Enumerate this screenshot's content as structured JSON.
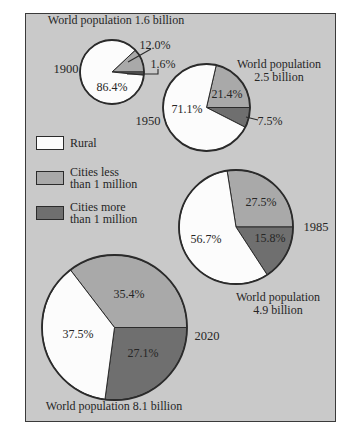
{
  "figure": {
    "bg": "#c9c9c9",
    "colors": {
      "bg": "#c9c9c9",
      "rural": "#fcfcfc",
      "less": "#a9a9a9",
      "more": "#6f6f6f",
      "outline": "#2b2b2b",
      "text": "#262626"
    }
  },
  "legend": {
    "items": [
      {
        "key": "rural",
        "lines": [
          "Rural"
        ]
      },
      {
        "key": "less",
        "lines": [
          "Cities less",
          "than 1 million"
        ]
      },
      {
        "key": "more",
        "lines": [
          "Cities more",
          "than 1 million"
        ]
      }
    ]
  },
  "chart_data": [
    {
      "type": "pie",
      "year": "1900",
      "total_population_billion": 1.6,
      "population_label_lines": [
        "World population 1.6 billion"
      ],
      "slices": [
        {
          "key": "less",
          "label": "Cities less than 1 million",
          "pct": 12.0,
          "display": "12.0%"
        },
        {
          "key": "more",
          "label": "Cities more than 1 million",
          "pct": 1.6,
          "display": "1.6%"
        },
        {
          "key": "rural",
          "label": "Rural",
          "pct": 86.4,
          "display": "86.4%"
        }
      ]
    },
    {
      "type": "pie",
      "year": "1950",
      "total_population_billion": 2.5,
      "population_label_lines": [
        "World population",
        "2.5 billion"
      ],
      "slices": [
        {
          "key": "less",
          "label": "Cities less than 1 million",
          "pct": 21.4,
          "display": "21.4%"
        },
        {
          "key": "more",
          "label": "Cities more than 1 million",
          "pct": 7.5,
          "display": "7.5%"
        },
        {
          "key": "rural",
          "label": "Rural",
          "pct": 71.1,
          "display": "71.1%"
        }
      ]
    },
    {
      "type": "pie",
      "year": "1985",
      "total_population_billion": 4.9,
      "population_label_lines": [
        "World population",
        "4.9 billion"
      ],
      "slices": [
        {
          "key": "less",
          "label": "Cities less than 1 million",
          "pct": 27.5,
          "display": "27.5%"
        },
        {
          "key": "more",
          "label": "Cities more than 1 million",
          "pct": 15.8,
          "display": "15.8%"
        },
        {
          "key": "rural",
          "label": "Rural",
          "pct": 56.7,
          "display": "56.7%"
        }
      ]
    },
    {
      "type": "pie",
      "year": "2020",
      "total_population_billion": 8.1,
      "population_label_lines": [
        "World population 8.1 billion"
      ],
      "slices": [
        {
          "key": "less",
          "label": "Cities less than 1 million",
          "pct": 35.4,
          "display": "35.4%"
        },
        {
          "key": "more",
          "label": "Cities more than 1 million",
          "pct": 27.1,
          "display": "27.1%"
        },
        {
          "key": "rural",
          "label": "Rural",
          "pct": 37.5,
          "display": "37.5%"
        }
      ]
    }
  ]
}
